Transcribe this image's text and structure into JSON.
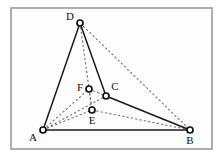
{
  "figure": {
    "frame": {
      "x": 11,
      "y": 8,
      "width": 201,
      "height": 141,
      "stroke_color": "#9a9a9a",
      "fill_color": "#fdfdfd"
    },
    "canvas": {
      "width": 224,
      "height": 160,
      "background": "#ffffff"
    },
    "style": {
      "solid_edge_color": "#1a1a1a",
      "dashed_edge_color": "#6d6d6d",
      "vertex_fill": "#ffffff",
      "vertex_stroke": "#111111",
      "label_color": "#111111"
    },
    "vertices": [
      {
        "id": "A",
        "label": "A",
        "x": 43,
        "y": 130,
        "label_x": 33,
        "label_y": 138,
        "radius": 3.0
      },
      {
        "id": "B",
        "label": "B",
        "x": 190,
        "y": 130,
        "label_x": 190,
        "label_y": 141,
        "radius": 3.0
      },
      {
        "id": "C",
        "label": "C",
        "x": 106,
        "y": 96,
        "label_x": 115,
        "label_y": 87,
        "radius": 3.0
      },
      {
        "id": "D",
        "label": "D",
        "x": 80,
        "y": 23,
        "label_x": 70,
        "label_y": 17,
        "radius": 3.0
      },
      {
        "id": "E",
        "label": "E",
        "x": 92,
        "y": 110,
        "label_x": 92,
        "label_y": 121,
        "radius": 3.0
      },
      {
        "id": "F",
        "label": "F",
        "x": 89,
        "y": 89,
        "label_x": 80,
        "label_y": 88,
        "radius": 3.0
      }
    ],
    "edges_solid": [
      {
        "id": "AD",
        "from": "A",
        "to": "D"
      },
      {
        "id": "DC",
        "from": "D",
        "to": "C"
      },
      {
        "id": "AB",
        "from": "A",
        "to": "B"
      },
      {
        "id": "CB",
        "from": "C",
        "to": "B"
      }
    ],
    "edges_dashed": [
      {
        "id": "DE",
        "from": "D",
        "to": "E"
      },
      {
        "id": "DB",
        "from": "D",
        "to": "B"
      },
      {
        "id": "AC",
        "from": "A",
        "to": "C"
      },
      {
        "id": "AF",
        "from": "A",
        "to": "F"
      },
      {
        "id": "AE",
        "from": "A",
        "to": "E"
      },
      {
        "id": "EB",
        "from": "E",
        "to": "B"
      },
      {
        "id": "FC",
        "from": "F",
        "to": "C"
      },
      {
        "id": "FE",
        "from": "F",
        "to": "E"
      }
    ]
  }
}
